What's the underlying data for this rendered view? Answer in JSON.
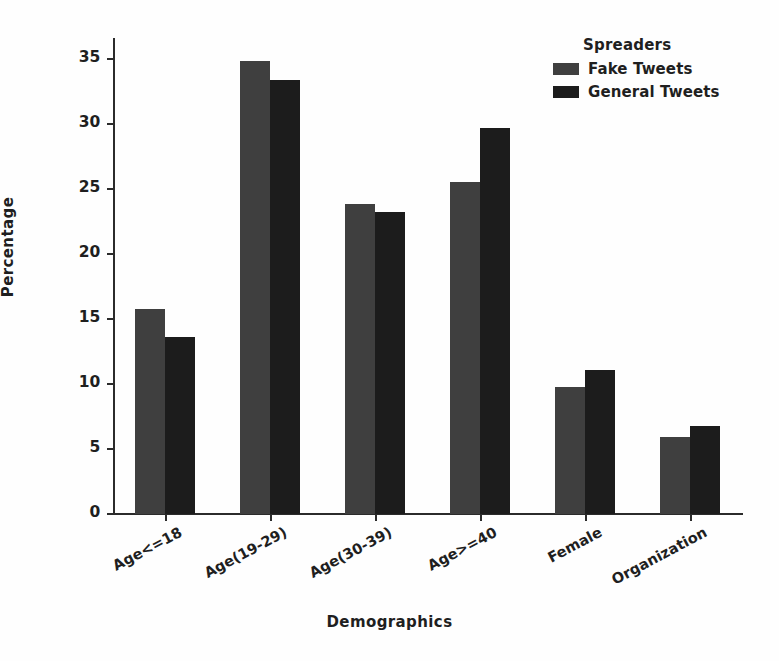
{
  "chart_data": {
    "type": "bar",
    "title": "",
    "xlabel": "Demographics",
    "ylabel": "Percentage",
    "categories": [
      "Age<=18",
      "Age(19-29)",
      "Age(30-39)",
      "Age>=40",
      "Female",
      "Organization"
    ],
    "series": [
      {
        "name": "Fake Tweets",
        "color": "#3f3f3f",
        "values": [
          15.8,
          34.8,
          23.8,
          25.5,
          9.8,
          5.9
        ]
      },
      {
        "name": "General Tweets",
        "color": "#1c1c1c",
        "values": [
          13.6,
          33.4,
          23.2,
          29.7,
          11.1,
          6.8
        ]
      }
    ],
    "legend": {
      "title": "Spreaders",
      "position": "top-right",
      "entries": [
        "Fake Tweets",
        "General Tweets"
      ]
    },
    "ylim": [
      0,
      36.6
    ],
    "yticks": [
      0,
      5,
      10,
      15,
      20,
      25,
      30,
      35
    ],
    "ytick_labels": [
      "0",
      "5",
      "10",
      "15",
      "20",
      "25",
      "30",
      "35"
    ],
    "grid": false,
    "xtick_label_rotation": -28
  },
  "style": {
    "background": "#fefefe",
    "axis_color": "#2b2b2b",
    "text_color": "#1f1f1f"
  }
}
